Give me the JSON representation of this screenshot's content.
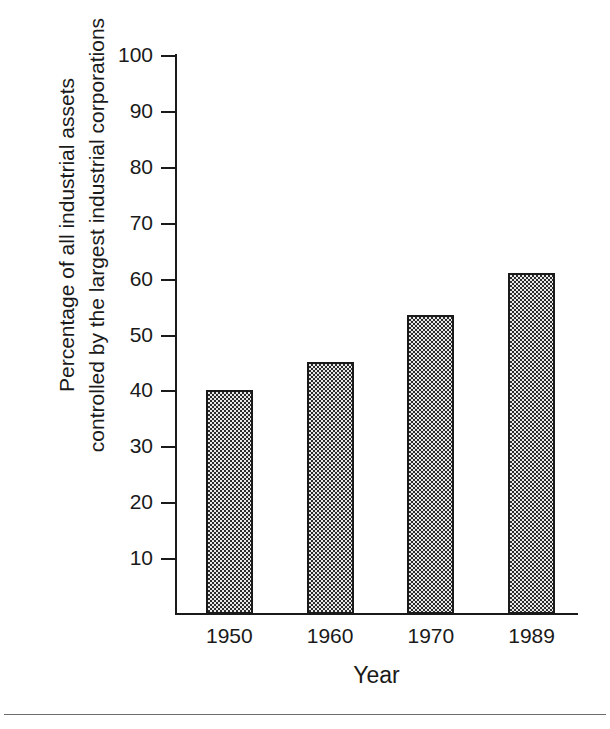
{
  "chart_data": {
    "type": "bar",
    "title": "",
    "categories": [
      "1950",
      "1960",
      "1970",
      "1989"
    ],
    "values": [
      40,
      45,
      53.5,
      61
    ],
    "xlabel": "Year",
    "ylabel": "Percentage of all industrial assets controlled by the largest industrial corporations",
    "ylabel_lines": [
      "Percentage of all industrial assets",
      "controlled by the largest industrial corporations"
    ],
    "ylim": [
      0,
      100
    ],
    "ytick_labels": [
      "10",
      "20",
      "30",
      "40",
      "50",
      "60",
      "70",
      "80",
      "90",
      "100"
    ],
    "ytick_values": [
      10,
      20,
      30,
      40,
      50,
      60,
      70,
      80,
      90,
      100
    ],
    "grid": false,
    "legend": false,
    "bar_fill": "#9a9a9a",
    "bar_pattern": "checkerboard-dither",
    "bar_edge_color": "#1a1a1a",
    "axis_color": "#1a1a1a",
    "background": "#ffffff"
  }
}
